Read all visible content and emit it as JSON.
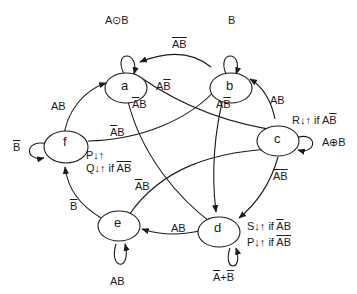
{
  "diagram": {
    "type": "state-diagram",
    "nodes": [
      {
        "id": "a",
        "label": "a"
      },
      {
        "id": "b",
        "label": "b"
      },
      {
        "id": "c",
        "label": "c"
      },
      {
        "id": "d",
        "label": "d"
      },
      {
        "id": "e",
        "label": "e"
      },
      {
        "id": "f",
        "label": "f"
      }
    ],
    "self_loops": {
      "a": "A⊙B",
      "b": "B",
      "c": "A⊕B",
      "d": "A+B (both barred)",
      "e": "AB",
      "f": "B̄"
    },
    "edges": [
      {
        "from": "b",
        "to": "a",
        "label": "ĀB̄"
      },
      {
        "from": "a",
        "to": "c",
        "label": "AB̄"
      },
      {
        "from": "a",
        "to": "d",
        "label": "ĀB"
      },
      {
        "from": "b",
        "to": "d",
        "label": "AB̄"
      },
      {
        "from": "c",
        "to": "b",
        "label": "AB"
      },
      {
        "from": "c",
        "to": "d",
        "label": "ĀB̄"
      },
      {
        "from": "d",
        "to": "e",
        "label": "AB"
      },
      {
        "from": "e",
        "to": "c",
        "label": "ĀB"
      },
      {
        "from": "e",
        "to": "f",
        "label": "B̄"
      },
      {
        "from": "f",
        "to": "a",
        "label": "AB"
      },
      {
        "from": "f",
        "to": "b",
        "label": "ĀB"
      }
    ],
    "node_outputs": {
      "c": "R↓↑ if AB̄",
      "d": [
        "S↓↑ if ĀB",
        "P↓↑ if ĀB̄"
      ],
      "f": [
        "P↓↑",
        "Q↓↑ if ĀB̄"
      ]
    }
  },
  "text": {
    "a": "a",
    "b": "b",
    "c": "c",
    "d": "d",
    "e": "e",
    "f": "f",
    "A": "A",
    "B": "B",
    "plus": "+",
    "xnor": "⊙",
    "xor": "⊕",
    "R": "R↓↑ if ",
    "S": "S↓↑ if ",
    "P": "P↓↑ if ",
    "Ponly": "P↓↑",
    "Q": "Q↓↑ if "
  }
}
